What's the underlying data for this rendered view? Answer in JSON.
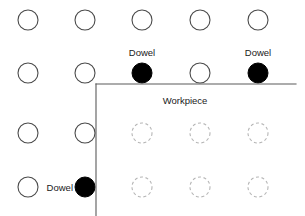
{
  "diagram": {
    "canvas": {
      "width": 305,
      "height": 216,
      "background": "#ffffff"
    },
    "colors": {
      "hole_open_stroke": "#4a4a4a",
      "hole_filled": "#000000",
      "hole_hidden_stroke": "#b4b4b4",
      "edge_stroke": "#5a5a5a",
      "label_text": "#1a1a1a"
    },
    "grid": {
      "columns": 5,
      "rows": 4,
      "column_centers_x": [
        28,
        85,
        142,
        200,
        258
      ],
      "row_centers_y": [
        20,
        73,
        133,
        187
      ],
      "hole_radius": 10
    },
    "workpiece": {
      "label": "Workpiece",
      "label_x": 185,
      "label_y": 104,
      "corner_x": 96,
      "corner_y": 84,
      "top_edge_end_x": 296,
      "left_edge_end_y": 216
    },
    "holes": [
      {
        "id": "r1c1",
        "row": 0,
        "col": 0,
        "cx": 28,
        "cy": 20,
        "style": "open"
      },
      {
        "id": "r1c2",
        "row": 0,
        "col": 1,
        "cx": 85,
        "cy": 20,
        "style": "open"
      },
      {
        "id": "r1c3",
        "row": 0,
        "col": 2,
        "cx": 142,
        "cy": 20,
        "style": "open"
      },
      {
        "id": "r1c4",
        "row": 0,
        "col": 3,
        "cx": 200,
        "cy": 20,
        "style": "open"
      },
      {
        "id": "r1c5",
        "row": 0,
        "col": 4,
        "cx": 258,
        "cy": 20,
        "style": "open"
      },
      {
        "id": "r2c1",
        "row": 1,
        "col": 0,
        "cx": 28,
        "cy": 73,
        "style": "open"
      },
      {
        "id": "r2c2",
        "row": 1,
        "col": 1,
        "cx": 85,
        "cy": 73,
        "style": "open"
      },
      {
        "id": "r2c3",
        "row": 1,
        "col": 2,
        "cx": 142,
        "cy": 73,
        "style": "filled"
      },
      {
        "id": "r2c4",
        "row": 1,
        "col": 3,
        "cx": 200,
        "cy": 73,
        "style": "open"
      },
      {
        "id": "r2c5",
        "row": 1,
        "col": 4,
        "cx": 258,
        "cy": 73,
        "style": "filled"
      },
      {
        "id": "r3c1",
        "row": 2,
        "col": 0,
        "cx": 28,
        "cy": 133,
        "style": "open"
      },
      {
        "id": "r3c2",
        "row": 2,
        "col": 1,
        "cx": 85,
        "cy": 133,
        "style": "open"
      },
      {
        "id": "r3c3",
        "row": 2,
        "col": 2,
        "cx": 142,
        "cy": 133,
        "style": "hidden"
      },
      {
        "id": "r3c4",
        "row": 2,
        "col": 3,
        "cx": 200,
        "cy": 133,
        "style": "hidden"
      },
      {
        "id": "r3c5",
        "row": 2,
        "col": 4,
        "cx": 258,
        "cy": 133,
        "style": "hidden"
      },
      {
        "id": "r4c1",
        "row": 3,
        "col": 0,
        "cx": 28,
        "cy": 187,
        "style": "open"
      },
      {
        "id": "r4c2",
        "row": 3,
        "col": 1,
        "cx": 85,
        "cy": 187,
        "style": "filled"
      },
      {
        "id": "r4c3",
        "row": 3,
        "col": 2,
        "cx": 142,
        "cy": 187,
        "style": "hidden"
      },
      {
        "id": "r4c4",
        "row": 3,
        "col": 3,
        "cx": 200,
        "cy": 187,
        "style": "hidden"
      },
      {
        "id": "r4c5",
        "row": 3,
        "col": 4,
        "cx": 258,
        "cy": 187,
        "style": "hidden"
      }
    ],
    "dowel_labels": [
      {
        "id": "dowel-top-left",
        "text": "Dowel",
        "x": 142,
        "y": 56,
        "anchor": "middle",
        "target": "r2c3"
      },
      {
        "id": "dowel-top-right",
        "text": "Dowel",
        "x": 258,
        "y": 56,
        "anchor": "middle",
        "target": "r2c5"
      },
      {
        "id": "dowel-bottom",
        "text": "Dowel",
        "x": 73,
        "y": 191,
        "anchor": "end",
        "target": "r4c2"
      }
    ]
  }
}
